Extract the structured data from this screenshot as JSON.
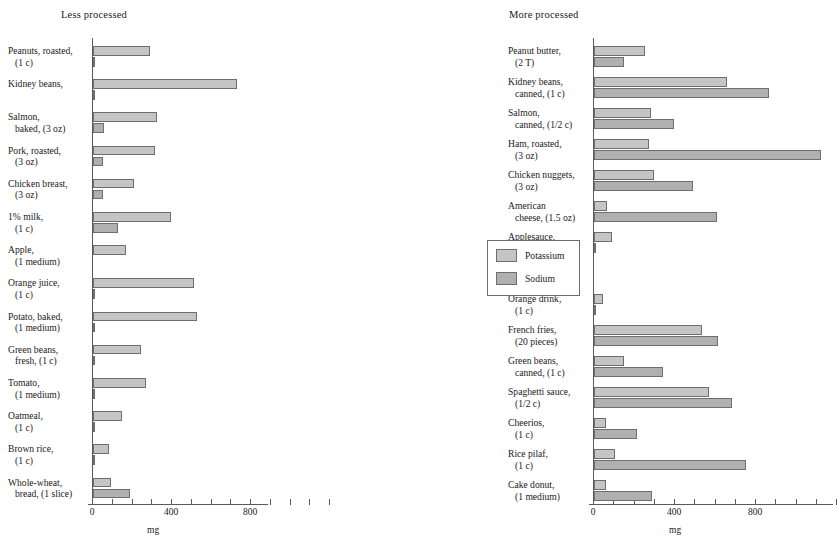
{
  "chart_data": {
    "type": "bar",
    "title": "",
    "orientation": "horizontal",
    "grouped": true,
    "xlabel": "mg",
    "ylabel": "",
    "xlim": [
      0,
      1200
    ],
    "xticks": [
      0,
      100,
      200,
      300,
      400,
      500,
      600,
      700,
      800,
      900,
      1000,
      1100,
      1200
    ],
    "xticklabels_shown": [
      "0",
      "400",
      "800"
    ],
    "grid": false,
    "legend": {
      "position": "right-middle",
      "entries": [
        {
          "name": "Potassium",
          "color": "#c5c5c5"
        },
        {
          "name": "Sodium",
          "color": "#b0b0b0"
        }
      ]
    },
    "panels": [
      {
        "id": "less-processed",
        "title": "Less processed",
        "axis_caption": "mg",
        "series": [
          "Potassium",
          "Sodium"
        ],
        "categories": [
          {
            "line1": "Peanuts, roasted,",
            "line2": "(1 c)",
            "potassium": 289,
            "sodium": 5
          },
          {
            "line1": "Kidney beans,",
            "line2": "",
            "potassium": 729,
            "sodium": 5
          },
          {
            "line1": "Salmon,",
            "line2": "baked, (3 oz)",
            "potassium": 324,
            "sodium": 56
          },
          {
            "line1": "Pork, roasted,",
            "line2": "(3 oz)",
            "potassium": 314,
            "sodium": 51
          },
          {
            "line1": "Chicken breast,",
            "line2": "(3 oz)",
            "potassium": 208,
            "sodium": 51
          },
          {
            "line1": "1% milk,",
            "line2": "(1 c)",
            "potassium": 395,
            "sodium": 127
          },
          {
            "line1": "Apple,",
            "line2": "(1 medium)",
            "potassium": 167,
            "sodium": 0
          },
          {
            "line1": "Orange juice,",
            "line2": "(1 c)",
            "potassium": 511,
            "sodium": 2
          },
          {
            "line1": "Potato, baked,",
            "line2": "(1 medium)",
            "potassium": 527,
            "sodium": 10
          },
          {
            "line1": "Green beans,",
            "line2": "fresh, (1 c)",
            "potassium": 243,
            "sodium": 3
          },
          {
            "line1": "Tomato,",
            "line2": "(1 medium)",
            "potassium": 268,
            "sodium": 10
          },
          {
            "line1": "Oatmeal,",
            "line2": "(1 c)",
            "potassium": 147,
            "sodium": 2
          },
          {
            "line1": "Brown rice,",
            "line2": "(1 c)",
            "potassium": 81,
            "sodium": 5
          },
          {
            "line1": "Whole-wheat,",
            "line2": "bread, (1 slice)",
            "potassium": 89,
            "sodium": 187
          }
        ]
      },
      {
        "id": "more-processed",
        "title": "More processed",
        "axis_caption": "mg",
        "series": [
          "Potassium",
          "Sodium"
        ],
        "categories": [
          {
            "line1": "Peanut butter,",
            "line2": "(2 T)",
            "potassium": 252,
            "sodium": 150
          },
          {
            "line1": "Kidney beans,",
            "line2": "canned, (1 c)",
            "potassium": 656,
            "sodium": 865
          },
          {
            "line1": "Salmon,",
            "line2": "canned, (1/2 c)",
            "potassium": 281,
            "sodium": 395
          },
          {
            "line1": "Ham, roasted,",
            "line2": "(3 oz)",
            "potassium": 273,
            "sodium": 1120
          },
          {
            "line1": "Chicken nuggets,",
            "line2": "(3 oz)",
            "potassium": 297,
            "sodium": 490
          },
          {
            "line1": "American",
            "line2": "cheese, (1.5 oz)",
            "potassium": 62,
            "sodium": 608
          },
          {
            "line1": "Applesauce,",
            "line2": "(1/2 c)",
            "potassium": 87,
            "sodium": 3
          },
          {
            "line1": "dry cooked, (1 c)",
            "line2": "",
            "potassium": 0,
            "sodium": 0
          },
          {
            "line1": "Orange drink,",
            "line2": "(1 c)",
            "potassium": 43,
            "sodium": 10
          },
          {
            "line1": "French fries,",
            "line2": "(20 pieces)",
            "potassium": 533,
            "sodium": 611
          },
          {
            "line1": "Green beans,",
            "line2": "canned, (1 c)",
            "potassium": 150,
            "sodium": 339
          },
          {
            "line1": "Spaghetti sauce,",
            "line2": "(1/2 c)",
            "potassium": 569,
            "sodium": 680
          },
          {
            "line1": "Cheerios,",
            "line2": "(1 c)",
            "potassium": 58,
            "sodium": 210
          },
          {
            "line1": "Rice pilaf,",
            "line2": "(1 c)",
            "potassium": 103,
            "sodium": 750
          },
          {
            "line1": "Cake donut,",
            "line2": "(1 medium)",
            "potassium": 58,
            "sodium": 285
          }
        ]
      }
    ]
  }
}
